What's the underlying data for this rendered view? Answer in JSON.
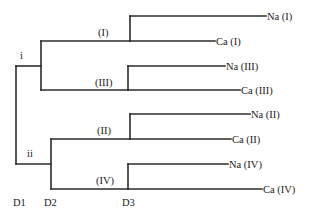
{
  "diagram": {
    "type": "dendrogram",
    "clusters": [
      {
        "id": "i",
        "label": "i"
      },
      {
        "id": "ii",
        "label": "ii"
      }
    ],
    "subclusters": [
      {
        "id": "I",
        "label": "(I)",
        "parent": "i"
      },
      {
        "id": "III",
        "label": "(III)",
        "parent": "i"
      },
      {
        "id": "II",
        "label": "(II)",
        "parent": "ii"
      },
      {
        "id": "IV",
        "label": "(IV)",
        "parent": "ii"
      }
    ],
    "leaves": [
      {
        "label": "Na (I)",
        "parent": "I"
      },
      {
        "label": "Ca (I)",
        "parent": "I"
      },
      {
        "label": "Na (III)",
        "parent": "III"
      },
      {
        "label": "Ca (III)",
        "parent": "III"
      },
      {
        "label": "Na (II)",
        "parent": "II"
      },
      {
        "label": "Ca (II)",
        "parent": "II"
      },
      {
        "label": "Na (IV)",
        "parent": "IV"
      },
      {
        "label": "Ca (IV)",
        "parent": "IV"
      }
    ],
    "level_labels": [
      "D1",
      "D2",
      "D3"
    ]
  }
}
